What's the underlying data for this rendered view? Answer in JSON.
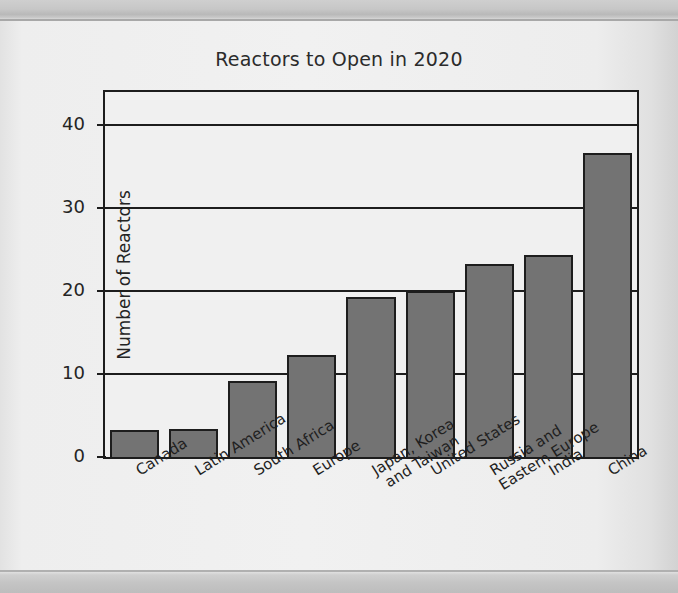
{
  "page": {
    "background_color": "#ebebeb",
    "edge_strip_color": "#c4c4c4"
  },
  "chart_data": {
    "type": "bar",
    "title": "Reactors to Open in 2020",
    "xlabel": "",
    "ylabel": "Number of Reactors",
    "ylim": [
      0,
      44
    ],
    "yticks": [
      0,
      10,
      20,
      30,
      40
    ],
    "ytick_labels": [
      "0",
      "10",
      "20",
      "30",
      "40"
    ],
    "grid": true,
    "grid_axis": "y",
    "legend": false,
    "bar_color": "#737373",
    "bar_edge_color": "#1d1d1d",
    "plot_background": "#f0f0f0",
    "categories": [
      "Canada",
      "Latin America",
      "South Africa",
      "Europe",
      "Japan, Korea\nand Taiwan",
      "United States",
      "Russia and\nEastern Europe",
      "India",
      "China"
    ],
    "values": [
      3.2,
      3.4,
      9.2,
      12.3,
      19.3,
      20.0,
      23.3,
      24.3,
      36.6
    ],
    "value_labels": [
      "3",
      "3",
      "9",
      "12",
      "19",
      "20",
      "23",
      "24",
      "37"
    ]
  }
}
